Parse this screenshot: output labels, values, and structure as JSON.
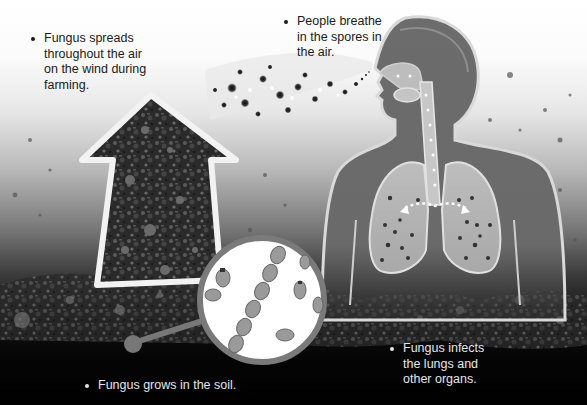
{
  "diagram": {
    "title": "",
    "palette": {
      "background_top": "#ffffff",
      "background_bottom": "#000000",
      "body_fill": "#6e6e6e",
      "body_outline": "#d9d9d9",
      "lung_fill": "#bdbdbd",
      "arrow_outline": "#f2f2f2",
      "magnifier_ring": "#7a7a7a",
      "magnifier_fill": "#ffffff"
    },
    "captions": [
      {
        "id": "spread",
        "text": "Fungus spreads throughout the air on the wind during farming.",
        "lines": [
          "Fungus spreads",
          "throughout the air",
          "on the wind during",
          "farming."
        ]
      },
      {
        "id": "breathe",
        "text": "People breathe in the spores in the air.",
        "lines": [
          "People breathe",
          "in the spores in",
          "the air."
        ]
      },
      {
        "id": "infects",
        "text": "Fungus infects the lungs and other organs.",
        "lines": [
          "Fungus infects",
          "the lungs and",
          "other organs."
        ]
      },
      {
        "id": "grows",
        "text": "Fungus grows in the soil.",
        "lines": [
          "Fungus grows in the soil."
        ]
      }
    ],
    "elements": [
      {
        "name": "soil-arrow",
        "description": "Upward arrow filled with soil texture"
      },
      {
        "name": "spore-cloud",
        "description": "Stream of spores blowing toward the person's nose"
      },
      {
        "name": "human-silhouette",
        "description": "Upper body with respiratory tract and lungs showing spores"
      },
      {
        "name": "magnifier",
        "description": "Magnified view of fungal spores/hyphae chains in soil"
      }
    ]
  }
}
